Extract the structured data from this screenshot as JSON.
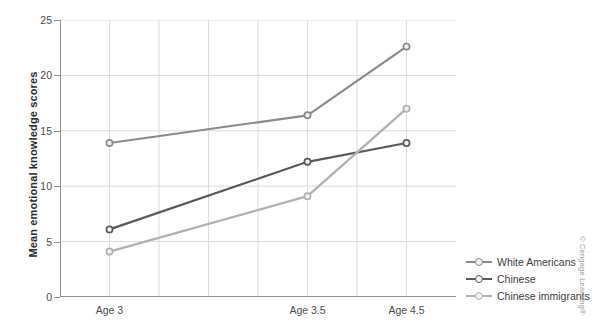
{
  "chart_data": {
    "type": "line",
    "title": "",
    "xlabel": "",
    "ylabel": "Mean emotional knowledge scores",
    "categories": [
      "Age 3",
      "Age 3.5",
      "Age 4.5"
    ],
    "x": [
      0,
      2,
      3
    ],
    "xlim": [
      -0.5,
      3.5
    ],
    "ylim": [
      0,
      25
    ],
    "yticks": [
      0,
      5,
      10,
      15,
      20,
      25
    ],
    "grid": true,
    "legend_position": "right",
    "series": [
      {
        "name": "White Americans",
        "values": [
          13.9,
          16.4,
          22.6
        ],
        "color": "#8a8a8a",
        "marker": "circle"
      },
      {
        "name": "Chinese",
        "values": [
          6.1,
          12.2,
          13.9
        ],
        "color": "#595959",
        "marker": "circle"
      },
      {
        "name": "Chinese immigrants",
        "values": [
          4.1,
          9.1,
          17.0
        ],
        "color": "#b0b0b0",
        "marker": "circle"
      }
    ]
  },
  "axis": {
    "y_tick_labels": [
      "0",
      "5",
      "10",
      "15",
      "20",
      "25"
    ],
    "x_tick_labels": [
      "Age 3",
      "Age 3.5",
      "Age 4.5"
    ],
    "y_title": "Mean emotional knowledge scores"
  },
  "legend": {
    "items": [
      {
        "label": "White Americans"
      },
      {
        "label": "Chinese"
      },
      {
        "label": "Chinese immigrants"
      }
    ]
  },
  "credit": {
    "text": "© Cengage Learning®"
  },
  "colors": {
    "axis_line": "#8d8d8d",
    "grid_line": "#dcdcdc",
    "text": "#3d3d3d",
    "background": "#ffffff"
  }
}
